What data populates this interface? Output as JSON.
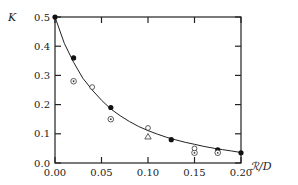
{
  "chart_data": {
    "type": "scatter",
    "title": "",
    "xlabel": "ℛ/D",
    "ylabel": "K",
    "xlim": [
      0.0,
      0.2
    ],
    "ylim": [
      0.0,
      0.5
    ],
    "xticks": [
      "0.00",
      "0.05",
      "0.10",
      "0.15",
      "0.20"
    ],
    "xtick_values": [
      0.0,
      0.05,
      0.1,
      0.15,
      0.2
    ],
    "yticks": [
      "0.0",
      "0.1",
      "0.2",
      "0.3",
      "0.4",
      "0.5"
    ],
    "ytick_values": [
      0.0,
      0.1,
      0.2,
      0.3,
      0.4,
      0.5
    ],
    "grid": false,
    "legend": null,
    "series": [
      {
        "name": "filled-circles",
        "marker": "filled-circle",
        "points": [
          [
            0.0,
            0.5
          ],
          [
            0.02,
            0.36
          ],
          [
            0.06,
            0.19
          ],
          [
            0.125,
            0.08
          ],
          [
            0.175,
            0.045
          ],
          [
            0.2,
            0.035
          ]
        ]
      },
      {
        "name": "dotted-circles",
        "marker": "circle-dot",
        "points": [
          [
            0.02,
            0.28
          ],
          [
            0.06,
            0.15
          ],
          [
            0.15,
            0.035
          ],
          [
            0.175,
            0.035
          ]
        ]
      },
      {
        "name": "open-circles",
        "marker": "open-circle",
        "points": [
          [
            0.04,
            0.26
          ],
          [
            0.1,
            0.12
          ],
          [
            0.15,
            0.05
          ]
        ]
      },
      {
        "name": "triangles",
        "marker": "open-triangle",
        "points": [
          [
            0.1,
            0.09
          ]
        ]
      }
    ],
    "fit_curve": {
      "name": "theory-curve",
      "points": [
        [
          0.0,
          0.5
        ],
        [
          0.01,
          0.41
        ],
        [
          0.02,
          0.345
        ],
        [
          0.03,
          0.29
        ],
        [
          0.04,
          0.25
        ],
        [
          0.05,
          0.215
        ],
        [
          0.06,
          0.185
        ],
        [
          0.07,
          0.162
        ],
        [
          0.08,
          0.142
        ],
        [
          0.09,
          0.125
        ],
        [
          0.1,
          0.111
        ],
        [
          0.11,
          0.099
        ],
        [
          0.12,
          0.088
        ],
        [
          0.13,
          0.079
        ],
        [
          0.14,
          0.071
        ],
        [
          0.15,
          0.064
        ],
        [
          0.16,
          0.057
        ],
        [
          0.17,
          0.051
        ],
        [
          0.18,
          0.046
        ],
        [
          0.19,
          0.041
        ],
        [
          0.2,
          0.036
        ]
      ]
    }
  }
}
